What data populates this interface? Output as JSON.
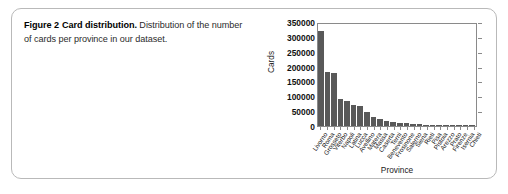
{
  "caption": {
    "figure_number": "Figure 2",
    "lead": "Card distribution.",
    "rest": "Distribution of the number of cards per province in our dataset."
  },
  "chart_data": {
    "type": "bar",
    "title": "",
    "xlabel": "Province",
    "ylabel": "Cards",
    "ylim": [
      0,
      350000
    ],
    "yticks": [
      0,
      50000,
      100000,
      150000,
      200000,
      250000,
      300000,
      350000
    ],
    "ytick_labels": [
      "350000",
      "300000",
      "250000",
      "200000",
      "150000",
      "100000",
      "50000",
      "0"
    ],
    "grid": false,
    "legend": "none",
    "bar_color": "#595959",
    "categories": [
      "Livorno",
      "Roma",
      "Grosseto",
      "Viterbo",
      "Napoli",
      "Latina",
      "Lucca",
      "Avellino",
      "Matera",
      "Massa",
      "Caserta",
      "Terni",
      "Benevento",
      "Frosinone",
      "Salerno",
      "Siena",
      "Rieti",
      "Pisa",
      "Pistoia",
      "Arezzo",
      "Prato",
      "Firenze",
      "Isernia",
      "Chieti"
    ],
    "values": [
      320000,
      182000,
      180000,
      92000,
      84000,
      70000,
      66000,
      46000,
      30000,
      22000,
      18000,
      14000,
      11000,
      9000,
      7500,
      6000,
      5000,
      4200,
      3500,
      3000,
      2500,
      2000,
      1600,
      1200
    ]
  }
}
